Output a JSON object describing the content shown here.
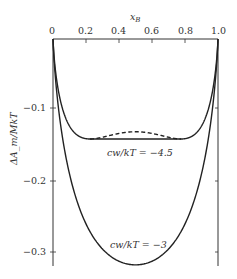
{
  "chart_data": {
    "type": "line",
    "title": "",
    "xlabel": "x_B",
    "ylabel": "ΔA_m/MkT",
    "xlim": [
      0,
      1.0
    ],
    "ylim": [
      -0.32,
      0
    ],
    "x_ticks": [
      "0",
      "0.2",
      "0.4",
      "0.6",
      "0.8",
      "1.0"
    ],
    "y_ticks": [
      "-0.1",
      "-0.2",
      "-0.3"
    ],
    "x_axis_position": "top",
    "grid": false,
    "series": [
      {
        "name": "cw/kT = -4.5",
        "style": "solid",
        "description": "Curve with two minima near x=0.15 and x=0.85 joined by horizontal common tangent at about -0.143",
        "x": [
          0,
          0.02,
          0.05,
          0.1,
          0.15,
          0.2,
          0.3,
          0.4,
          0.5,
          0.6,
          0.7,
          0.8,
          0.85,
          0.9,
          0.95,
          0.98,
          1.0
        ],
        "values": [
          0,
          -0.053,
          -0.092,
          -0.124,
          -0.136,
          -0.139,
          -0.14,
          -0.141,
          -0.141,
          -0.141,
          -0.14,
          -0.139,
          -0.136,
          -0.124,
          -0.092,
          -0.053,
          0
        ]
      },
      {
        "name": "cw/kT = -4.5 (unstable region)",
        "style": "dashed",
        "x": [
          0.2,
          0.3,
          0.4,
          0.5,
          0.6,
          0.7,
          0.8
        ],
        "values": [
          -0.14,
          -0.137,
          -0.132,
          -0.131,
          -0.132,
          -0.137,
          -0.14
        ]
      },
      {
        "name": "cw/kT = -3",
        "style": "solid",
        "x": [
          0,
          0.02,
          0.05,
          0.1,
          0.2,
          0.3,
          0.4,
          0.5,
          0.6,
          0.7,
          0.8,
          0.9,
          0.95,
          0.98,
          1.0
        ],
        "values": [
          0,
          -0.069,
          -0.127,
          -0.19,
          -0.26,
          -0.296,
          -0.313,
          -0.318,
          -0.313,
          -0.296,
          -0.26,
          -0.19,
          -0.127,
          -0.069,
          0
        ]
      }
    ],
    "annotations": [
      "cw/kT = −4.5",
      "cw/kT = −3"
    ]
  },
  "labels": {
    "xlabel": "x",
    "xlabel_sub": "B",
    "ylabel": "ΔA_m/MkT",
    "x_ticks": [
      "0",
      "0.2",
      "0.4",
      "0.6",
      "0.8",
      "1.0"
    ],
    "y_ticks": [
      "−0.1",
      "−0.2",
      "−0.3"
    ],
    "curve1_label": "cw/kT = −4.5",
    "curve2_label": "cw/kT = −3"
  }
}
